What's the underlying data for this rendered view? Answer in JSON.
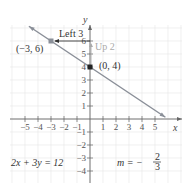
{
  "chart_data": {
    "type": "line",
    "title": "",
    "xlabel": "x",
    "ylabel": "y",
    "xlim": [
      -6,
      6
    ],
    "ylim": [
      -4.5,
      7
    ],
    "grid": true,
    "x_ticks": [
      -5,
      -4,
      -3,
      -2,
      -1,
      1,
      2,
      3,
      4,
      5
    ],
    "y_ticks": [
      -4,
      -3,
      -2,
      -1,
      1,
      2,
      3,
      4,
      5,
      6
    ],
    "x_tick_labels": [
      "−5",
      "−4",
      "−3",
      "−2",
      "−1",
      "1",
      "2",
      "3",
      "4",
      "5"
    ],
    "y_tick_labels": [
      "−4",
      "−3",
      "−2",
      "−1",
      "1",
      "2",
      "3",
      "4",
      "5",
      "6"
    ],
    "series": [
      {
        "name": "2x + 3y = 12",
        "x": [
          -4.5,
          6
        ],
        "y": [
          7,
          0
        ],
        "color": "#8a8f98"
      }
    ],
    "points": [
      {
        "label": "(−3, 6)",
        "x": -3,
        "y": 6,
        "color": "#8a8f98"
      },
      {
        "label": "(0, 4)",
        "x": 0,
        "y": 4,
        "color": "#222222"
      }
    ],
    "annotations": [
      {
        "text": "Left 3",
        "from": [
          0,
          6
        ],
        "to": [
          -3,
          6
        ],
        "color": "#333333"
      },
      {
        "text": "Up 2",
        "from": [
          0,
          4
        ],
        "to": [
          0,
          6
        ],
        "color": "#aaaaaa"
      },
      {
        "text": "2x + 3y = 12",
        "position": "bottom-left"
      },
      {
        "text": "m = −2/3",
        "position": "bottom-right"
      }
    ]
  },
  "labels": {
    "x_axis": "x",
    "y_axis": "y",
    "point_a": "(−3, 6)",
    "point_b": "(0, 4)",
    "left": "Left 3",
    "up": "Up 2",
    "equation": "2x + 3y = 12",
    "slope_prefix": "m = −",
    "slope_num": "2",
    "slope_den": "3"
  }
}
